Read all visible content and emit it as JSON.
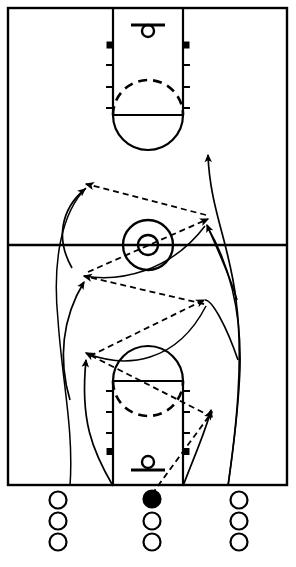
{
  "diagram": {
    "type": "basketball-court-play",
    "orientation": "vertical-full-court",
    "colors": {
      "court_line": "#000000",
      "background": "#ffffff",
      "ball_handler": "#000000",
      "open_player": "#ffffff"
    },
    "canvas": {
      "width": 296,
      "height": 567
    }
  },
  "court": {
    "name": "full-court",
    "boundary": {
      "x": 8,
      "y": 8,
      "width": 279,
      "height": 477
    },
    "line_width": 2.2,
    "halfcourt_line_y": 245,
    "center_circle": {
      "cx": 148,
      "cy": 245,
      "r_outer": 25,
      "r_inner": 10
    },
    "keys": [
      {
        "name": "top-key",
        "end": "top",
        "lane": {
          "x": 113,
          "y": 8,
          "width": 70,
          "height": 107
        },
        "free_throw_line_y": 115,
        "free_throw_circle_r": 35,
        "solid_arc": "below-line",
        "dashed_arc": "above-line",
        "backboard": {
          "x1": 131,
          "x2": 165,
          "y": 25
        },
        "hoop": {
          "cx": 148,
          "cy": 31,
          "r": 6
        },
        "lane_blocks": [
          45
        ],
        "lane_ticks": [
          65,
          87,
          108
        ]
      },
      {
        "name": "bottom-key",
        "end": "bottom",
        "lane": {
          "x": 113,
          "y": 381,
          "width": 70,
          "height": 104
        },
        "free_throw_line_y": 381,
        "free_throw_circle_r": 35,
        "solid_arc": "above-line",
        "dashed_arc": "below-line",
        "backboard": {
          "x1": 131,
          "x2": 165,
          "y": 470
        },
        "hoop": {
          "cx": 148,
          "cy": 463,
          "r": 6
        },
        "lane_blocks": [
          450
        ],
        "lane_ticks": [
          398,
          420,
          441
        ]
      }
    ]
  },
  "players": {
    "label": "player-lines",
    "radius": 8.5,
    "columns": [
      {
        "name": "left-line",
        "x": 58,
        "spots": [
          {
            "y": 500,
            "has_ball": false
          },
          {
            "y": 521,
            "has_ball": false
          },
          {
            "y": 542,
            "has_ball": false
          }
        ]
      },
      {
        "name": "middle-line",
        "x": 152,
        "spots": [
          {
            "y": 499,
            "has_ball": true
          },
          {
            "y": 521,
            "has_ball": false
          },
          {
            "y": 542,
            "has_ball": false
          }
        ]
      },
      {
        "name": "right-line",
        "x": 239,
        "spots": [
          {
            "y": 500,
            "has_ball": false
          },
          {
            "y": 521,
            "has_ball": false
          },
          {
            "y": 542,
            "has_ball": false
          }
        ]
      }
    ]
  },
  "passes": {
    "label": "pass-sequence-dashed",
    "style": "dashed-with-arrowhead",
    "dash": "6 4",
    "stroke_width": 1.8,
    "segments": [
      {
        "id": 1,
        "from": [
          152,
          494
        ],
        "to": [
          212,
          412
        ],
        "note": "ball out to right wing"
      },
      {
        "id": 2,
        "from": [
          212,
          417
        ],
        "to": [
          86,
          353
        ],
        "note": "right wing back across to left"
      },
      {
        "id": 3,
        "from": [
          90,
          356
        ],
        "to": [
          204,
          300
        ],
        "note": "left to right"
      },
      {
        "id": 4,
        "from": [
          204,
          304
        ],
        "to": [
          84,
          276
        ],
        "note": "right to left"
      },
      {
        "id": 5,
        "from": [
          88,
          272
        ],
        "to": [
          208,
          219
        ],
        "note": "left to right past center"
      },
      {
        "id": 6,
        "from": [
          206,
          215
        ],
        "to": [
          86,
          184
        ],
        "note": "right to left top"
      }
    ]
  },
  "cuts": {
    "label": "cut-paths-solid",
    "style": "solid-curve-with-arrowhead",
    "stroke_width": 1.7,
    "paths": [
      {
        "id": "cut-right-1",
        "note": "right-lane cut from baseline up to mid-court"
      },
      {
        "id": "cut-left-1",
        "note": "left-lane weave cut upward"
      },
      {
        "id": "cut-right-2",
        "note": "right weave continuing to far wing"
      },
      {
        "id": "cut-left-2",
        "note": "left weave continuing upward to far side"
      },
      {
        "id": "cut-long-right",
        "note": "long outside cut finishing above center circle"
      }
    ]
  },
  "legend": {
    "dashed_meaning": "pass",
    "solid_meaning": "player cut / movement",
    "filled_circle_meaning": "player with ball",
    "open_circle_meaning": "player without ball"
  }
}
